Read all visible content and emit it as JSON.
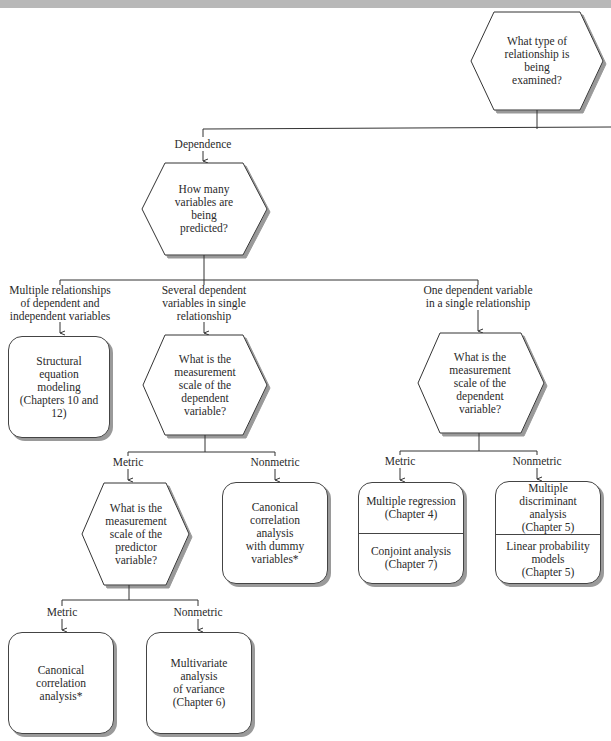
{
  "header": {
    "title": ""
  },
  "diagram": {
    "root": {
      "question": [
        "What type of",
        "relationship is",
        "being",
        "examined?"
      ]
    },
    "branch_dependence": {
      "label": "Dependence"
    },
    "q_predicted": {
      "question": [
        "How many",
        "variables are",
        "being",
        "predicted?"
      ]
    },
    "branches_predicted": [
      {
        "label": [
          "Multiple relationships",
          "of dependent and",
          "independent variables"
        ]
      },
      {
        "label": [
          "Several dependent",
          "variables in single",
          "relationship"
        ]
      },
      {
        "label": [
          "One dependent variable",
          "in a single relationship"
        ]
      }
    ],
    "sem_box": {
      "text": [
        "Structural",
        "equation",
        "modeling",
        "(Chapters 10 and 12)"
      ]
    },
    "q_scale_several": {
      "question": [
        "What is the",
        "measurement",
        "scale of the",
        "dependent",
        "variable?"
      ]
    },
    "q_scale_one": {
      "question": [
        "What is the",
        "measurement",
        "scale of the",
        "dependent",
        "variable?"
      ]
    },
    "several_metric_label": "Metric",
    "several_nonmetric_label": "Nonmetric",
    "q_predictor": {
      "question": [
        "What is the",
        "measurement",
        "scale of the",
        "predictor",
        "variable?"
      ]
    },
    "canonical_dummy_box": {
      "text": [
        "Canonical",
        "correlation",
        "analysis",
        "with dummy",
        "variables*"
      ]
    },
    "one_metric_label": "Metric",
    "one_nonmetric_label": "Nonmetric",
    "metric_box": {
      "top": [
        "Multiple regression",
        "(Chapter 4)"
      ],
      "bottom": [
        "Conjoint analysis",
        "(Chapter 7)"
      ]
    },
    "nonmetric_box": {
      "top": [
        "Multiple",
        "discriminant",
        "analysis",
        "(Chapter 5)"
      ],
      "bottom": [
        "Linear probability",
        "models",
        "(Chapter 5)"
      ]
    },
    "predictor_metric_label": "Metric",
    "predictor_nonmetric_label": "Nonmetric",
    "canonical_box": {
      "text": [
        "Canonical",
        "correlation",
        "analysis*"
      ]
    },
    "manova_box": {
      "text": [
        "Multivariate",
        "analysis",
        "of variance",
        "(Chapter 6)"
      ]
    }
  }
}
